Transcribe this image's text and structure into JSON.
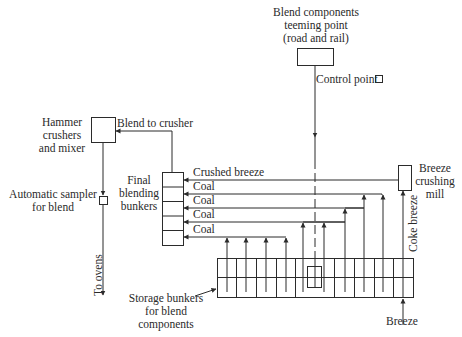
{
  "diagram": {
    "type": "process-flow",
    "nodes": {
      "teeming_point": {
        "label_lines": [
          "Blend components",
          "teeming point",
          "(road and rail)"
        ]
      },
      "control_point": {
        "label": "Control point"
      },
      "hammer_crushers": {
        "label_lines": [
          "Hammer",
          "crushers",
          "and mixer"
        ]
      },
      "automatic_sampler": {
        "label_lines": [
          "Automatic sampler",
          "for blend"
        ]
      },
      "final_blending": {
        "label_lines": [
          "Final",
          "blending",
          "bunkers"
        ],
        "cells": 5
      },
      "breeze_mill": {
        "label_lines": [
          "Breeze",
          "crushing",
          "mill"
        ]
      },
      "storage_bunkers": {
        "label_lines": [
          "Storage bunkers",
          "for blend",
          "components"
        ],
        "columns": 10
      }
    },
    "flows": {
      "blend_to_crusher": "Blend to crusher",
      "crushed_breeze": "Crushed breeze",
      "coal_1": "Coal",
      "coal_2": "Coal",
      "coal_3": "Coal",
      "coal_4": "Coal",
      "coke_breeze": "Coke breeze",
      "to_ovens": "To ovens",
      "breeze": "Breeze"
    },
    "colors": {
      "line": "#2b2b2b",
      "background": "#ffffff"
    }
  }
}
